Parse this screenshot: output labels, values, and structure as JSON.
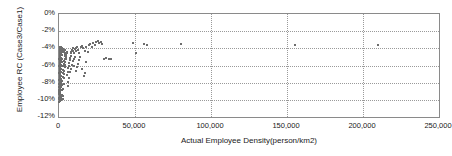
{
  "chart_data": {
    "type": "scatter",
    "title": "",
    "xlabel": "Actual Employee Density(person/km2)",
    "ylabel": "Employee RC (Case3/Case1)",
    "xlim": [
      0,
      250000
    ],
    "ylim": [
      -12,
      0
    ],
    "xticks": [
      0,
      50000,
      100000,
      150000,
      200000,
      250000
    ],
    "xticklabels": [
      "0",
      "50,000",
      "100,000",
      "150,000",
      "200,000",
      "250,000"
    ],
    "yticks": [
      0,
      -2,
      -4,
      -6,
      -8,
      -10,
      -12
    ],
    "yticklabels": [
      "0%",
      "-2%",
      "-4%",
      "-6%",
      "-8%",
      "-10%",
      "-12%"
    ],
    "grid": true,
    "grid_style": "dotted",
    "legend": "none",
    "marker": "square",
    "marker_color": "#6d6d6d",
    "marker_size_px": 2,
    "series": [
      {
        "name": "Employee RC",
        "points": [
          [
            300,
            -9.9
          ],
          [
            400,
            -9.95
          ],
          [
            500,
            -10.0
          ],
          [
            600,
            -9.8
          ],
          [
            700,
            -10.05
          ],
          [
            350,
            -9.6
          ],
          [
            450,
            -9.5
          ],
          [
            800,
            -9.7
          ],
          [
            900,
            -9.9
          ],
          [
            1000,
            -10.0
          ],
          [
            250,
            -9.3
          ],
          [
            550,
            -9.2
          ],
          [
            650,
            -9.4
          ],
          [
            1100,
            -9.85
          ],
          [
            1200,
            -9.95
          ],
          [
            300,
            -8.9
          ],
          [
            420,
            -8.8
          ],
          [
            520,
            -9.0
          ],
          [
            720,
            -9.1
          ],
          [
            980,
            -9.3
          ],
          [
            260,
            -8.5
          ],
          [
            380,
            -8.4
          ],
          [
            620,
            -8.6
          ],
          [
            840,
            -8.7
          ],
          [
            1050,
            -8.8
          ],
          [
            320,
            -8.1
          ],
          [
            480,
            -8.0
          ],
          [
            560,
            -8.2
          ],
          [
            760,
            -8.3
          ],
          [
            1150,
            -8.5
          ],
          [
            280,
            -7.7
          ],
          [
            440,
            -7.6
          ],
          [
            600,
            -7.8
          ],
          [
            880,
            -7.9
          ],
          [
            1300,
            -8.0
          ],
          [
            340,
            -7.3
          ],
          [
            500,
            -7.2
          ],
          [
            680,
            -7.4
          ],
          [
            920,
            -7.5
          ],
          [
            1400,
            -7.6
          ],
          [
            300,
            -6.9
          ],
          [
            460,
            -6.8
          ],
          [
            640,
            -7.0
          ],
          [
            860,
            -7.1
          ],
          [
            1250,
            -7.2
          ],
          [
            360,
            -6.5
          ],
          [
            540,
            -6.4
          ],
          [
            700,
            -6.6
          ],
          [
            1000,
            -6.7
          ],
          [
            1500,
            -6.8
          ],
          [
            310,
            -6.1
          ],
          [
            470,
            -6.0
          ],
          [
            660,
            -6.2
          ],
          [
            940,
            -6.3
          ],
          [
            1600,
            -6.4
          ],
          [
            330,
            -5.7
          ],
          [
            510,
            -5.6
          ],
          [
            720,
            -5.8
          ],
          [
            1080,
            -5.9
          ],
          [
            1700,
            -6.0
          ],
          [
            290,
            -5.3
          ],
          [
            490,
            -5.2
          ],
          [
            690,
            -5.4
          ],
          [
            1020,
            -5.5
          ],
          [
            1800,
            -5.6
          ],
          [
            350,
            -4.9
          ],
          [
            530,
            -4.8
          ],
          [
            740,
            -5.0
          ],
          [
            1120,
            -5.1
          ],
          [
            1900,
            -5.2
          ],
          [
            370,
            -4.5
          ],
          [
            560,
            -4.4
          ],
          [
            780,
            -4.6
          ],
          [
            1180,
            -4.7
          ],
          [
            2000,
            -4.8
          ],
          [
            390,
            -4.1
          ],
          [
            580,
            -4.0
          ],
          [
            800,
            -4.2
          ],
          [
            1240,
            -4.3
          ],
          [
            2100,
            -4.4
          ],
          [
            410,
            -3.9
          ],
          [
            620,
            -3.8
          ],
          [
            850,
            -3.95
          ],
          [
            1320,
            -4.05
          ],
          [
            2200,
            -4.15
          ],
          [
            1500,
            -9.7
          ],
          [
            1700,
            -9.4
          ],
          [
            1900,
            -8.9
          ],
          [
            2100,
            -8.3
          ],
          [
            2300,
            -7.8
          ],
          [
            2500,
            -7.3
          ],
          [
            2700,
            -6.9
          ],
          [
            2900,
            -6.5
          ],
          [
            3100,
            -6.1
          ],
          [
            3300,
            -5.8
          ],
          [
            3500,
            -5.5
          ],
          [
            3700,
            -5.2
          ],
          [
            3900,
            -4.9
          ],
          [
            4100,
            -4.7
          ],
          [
            4300,
            -4.5
          ],
          [
            2400,
            -9.9
          ],
          [
            2600,
            -9.5
          ],
          [
            2800,
            -8.7
          ],
          [
            3000,
            -8.1
          ],
          [
            3200,
            -7.5
          ],
          [
            3400,
            -7.0
          ],
          [
            3600,
            -6.6
          ],
          [
            3800,
            -6.2
          ],
          [
            4000,
            -5.9
          ],
          [
            4200,
            -5.6
          ],
          [
            4400,
            -5.3
          ],
          [
            4600,
            -5.0
          ],
          [
            4800,
            -4.8
          ],
          [
            5000,
            -4.6
          ],
          [
            5200,
            -4.4
          ],
          [
            5500,
            -7.1
          ],
          [
            5800,
            -6.7
          ],
          [
            6100,
            -6.3
          ],
          [
            6400,
            -6.0
          ],
          [
            6700,
            -5.7
          ],
          [
            7000,
            -5.4
          ],
          [
            7300,
            -5.1
          ],
          [
            7600,
            -4.9
          ],
          [
            7900,
            -4.6
          ],
          [
            8200,
            -4.4
          ],
          [
            5600,
            -8.4
          ],
          [
            6000,
            -7.9
          ],
          [
            6500,
            -7.4
          ],
          [
            7100,
            -6.8
          ],
          [
            7700,
            -6.4
          ],
          [
            8500,
            -4.2
          ],
          [
            8900,
            -4.0
          ],
          [
            9300,
            -4.3
          ],
          [
            9700,
            -4.5
          ],
          [
            10200,
            -4.1
          ],
          [
            8800,
            -5.9
          ],
          [
            9200,
            -5.5
          ],
          [
            9600,
            -5.2
          ],
          [
            10000,
            -6.1
          ],
          [
            10500,
            -5.0
          ],
          [
            11000,
            -4.3
          ],
          [
            11500,
            -4.0
          ],
          [
            12000,
            -3.8
          ],
          [
            12500,
            -4.2
          ],
          [
            13000,
            -4.6
          ],
          [
            11200,
            -6.6
          ],
          [
            11800,
            -6.2
          ],
          [
            12400,
            -5.8
          ],
          [
            13200,
            -5.4
          ],
          [
            14000,
            -5.0
          ],
          [
            14500,
            -3.9
          ],
          [
            15200,
            -3.7
          ],
          [
            16000,
            -4.0
          ],
          [
            16800,
            -4.3
          ],
          [
            17500,
            -3.8
          ],
          [
            15000,
            -6.4
          ],
          [
            16200,
            -7.2
          ],
          [
            17000,
            -6.9
          ],
          [
            18000,
            -5.6
          ],
          [
            19000,
            -4.4
          ],
          [
            19500,
            -3.6
          ],
          [
            20500,
            -3.5
          ],
          [
            21500,
            -3.8
          ],
          [
            22500,
            -3.4
          ],
          [
            23500,
            -3.6
          ],
          [
            24500,
            -3.3
          ],
          [
            25500,
            -3.2
          ],
          [
            26500,
            -3.4
          ],
          [
            27500,
            -3.3
          ],
          [
            28500,
            -3.5
          ],
          [
            29500,
            -5.2
          ],
          [
            31000,
            -5.1
          ],
          [
            33000,
            -5.2
          ],
          [
            34500,
            -5.3
          ],
          [
            49000,
            -3.4
          ],
          [
            50500,
            -4.5
          ],
          [
            56000,
            -3.5
          ],
          [
            58000,
            -3.6
          ],
          [
            80000,
            -3.5
          ],
          [
            155000,
            -3.6
          ],
          [
            210000,
            -3.6
          ],
          [
            600,
            -4.6
          ],
          [
            700,
            -4.3
          ],
          [
            800,
            -4.55
          ],
          [
            900,
            -4.25
          ],
          [
            1000,
            -3.95
          ],
          [
            1100,
            -4.15
          ],
          [
            1250,
            -3.85
          ],
          [
            1350,
            -4.35
          ],
          [
            500,
            -7.05
          ],
          [
            620,
            -6.75
          ],
          [
            740,
            -6.45
          ],
          [
            860,
            -6.15
          ],
          [
            480,
            -8.35
          ],
          [
            560,
            -8.65
          ],
          [
            640,
            -8.95
          ],
          [
            720,
            -9.25
          ],
          [
            1600,
            -4.2
          ],
          [
            1800,
            -4.05
          ],
          [
            2050,
            -3.95
          ],
          [
            2400,
            -4.1
          ],
          [
            2800,
            -4.3
          ],
          [
            3200,
            -4.45
          ],
          [
            3700,
            -4.6
          ],
          [
            4200,
            -4.25
          ],
          [
            380,
            -9.45
          ],
          [
            420,
            -9.15
          ],
          [
            460,
            -8.85
          ],
          [
            520,
            -10.1
          ],
          [
            340,
            -10.15
          ],
          [
            300,
            -10.2
          ],
          [
            260,
            -9.75
          ],
          [
            240,
            -9.05
          ]
        ]
      }
    ]
  }
}
